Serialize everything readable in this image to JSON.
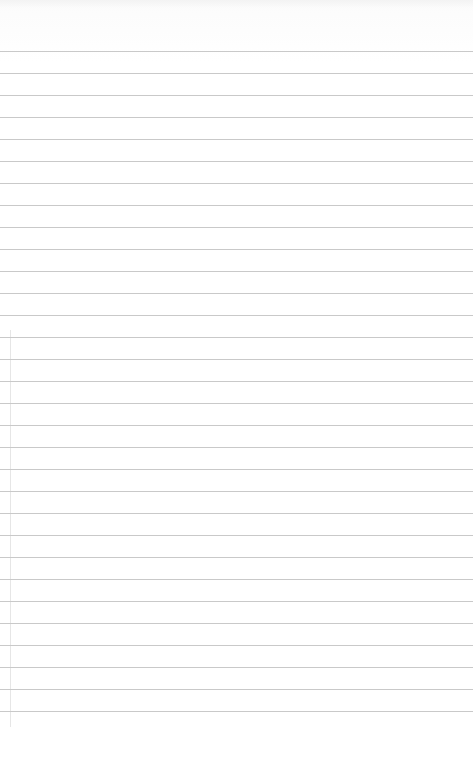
{
  "page": {
    "kind": "lined-paper",
    "background_color": "#ffffff",
    "rule_color": "#c9c9c9",
    "margin_color": "#e6e6e6"
  },
  "rules": {
    "first_y": 51,
    "spacing": 22,
    "count": 31
  }
}
